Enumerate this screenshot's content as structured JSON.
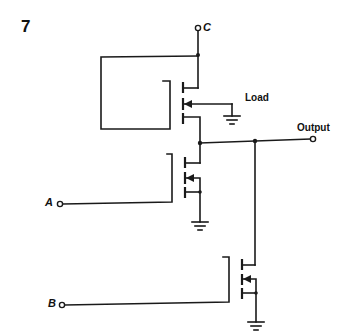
{
  "figure": {
    "number": "7",
    "type": "circuit-schematic"
  },
  "labels": {
    "supply": "C",
    "load": "Load",
    "output": "Output",
    "input_a": "A",
    "input_b": "B"
  },
  "components": [
    {
      "name": "load-transistor",
      "label": "Load",
      "type": "mosfet-depletion"
    },
    {
      "name": "input-transistor-a",
      "input": "A",
      "type": "mosfet-enhancement"
    },
    {
      "name": "input-transistor-b",
      "input": "B",
      "type": "mosfet-enhancement"
    }
  ],
  "colors": {
    "ink": "#1a1a1a",
    "background": "#ffffff"
  }
}
